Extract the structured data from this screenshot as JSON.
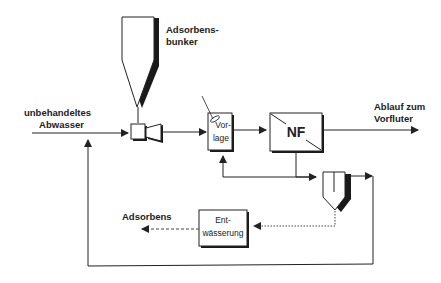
{
  "diagram": {
    "type": "process-flow",
    "labels": {
      "input_line1": "unbehandeltes",
      "input_line2": "Abwasser",
      "bunker_line1": "Adsorbens-",
      "bunker_line2": "bunker",
      "output_line1": "Ablauf zum",
      "output_line2": "Vorfluter",
      "adsorbens_out": "Adsorbens"
    },
    "nodes": {
      "vorlage": {
        "line1": "Vor-",
        "line2": "lage"
      },
      "nf": {
        "label": "NF"
      },
      "entwaesserung": {
        "line1": "Ent-",
        "line2": "wässerung"
      }
    },
    "components": [
      "Adsorbensbunker",
      "Dosierpumpe",
      "Vorlage",
      "NF",
      "Absetzbecken",
      "Entwässerung"
    ],
    "colors": {
      "line": "#2a2a2a",
      "shadow": "#1a1a1a",
      "background": "#ffffff"
    }
  }
}
